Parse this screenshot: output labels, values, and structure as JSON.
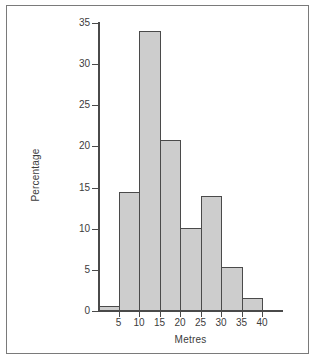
{
  "figure": {
    "background_color": "#ffffff",
    "frame_color": "#7a7a7a",
    "axis_color": "#4a4a4a",
    "bar_fill_color": "#cdcdcd",
    "bar_edge_color": "#4a4a4a"
  },
  "chart_data": {
    "type": "bar",
    "title": "",
    "subtitle": "",
    "xlabel": "Metres",
    "ylabel": "Percentage",
    "grid": false,
    "legend": null,
    "legend_position": "none",
    "xlim": [
      0,
      40
    ],
    "ylim": [
      0,
      35
    ],
    "xticks": [
      5,
      10,
      15,
      20,
      25,
      30,
      35,
      40
    ],
    "xtick_labels": [
      "5",
      "10",
      "15",
      "20",
      "25",
      "30",
      "35",
      "40"
    ],
    "yticks": [
      0,
      5,
      10,
      15,
      20,
      25,
      30,
      35
    ],
    "ytick_labels": [
      "0",
      "5",
      "10",
      "15",
      "20",
      "25",
      "30",
      "35"
    ],
    "bin_width": 5,
    "bin_edges": [
      0,
      5,
      10,
      15,
      20,
      25,
      30,
      35,
      40
    ],
    "categories": [
      "0-5",
      "5-10",
      "10-15",
      "15-20",
      "20-25",
      "25-30",
      "30-35",
      "35-40"
    ],
    "values": [
      0.6,
      14.5,
      34.0,
      20.8,
      10.1,
      14.0,
      5.4,
      1.6
    ],
    "bars": [
      {
        "label": "0-5",
        "x0": 0,
        "x1": 5,
        "value": 0.6
      },
      {
        "label": "5-10",
        "x0": 5,
        "x1": 10,
        "value": 14.5
      },
      {
        "label": "10-15",
        "x0": 10,
        "x1": 15,
        "value": 34.0
      },
      {
        "label": "15-20",
        "x0": 15,
        "x1": 20,
        "value": 20.8
      },
      {
        "label": "20-25",
        "x0": 20,
        "x1": 25,
        "value": 10.1
      },
      {
        "label": "25-30",
        "x0": 25,
        "x1": 30,
        "value": 14.0
      },
      {
        "label": "30-35",
        "x0": 30,
        "x1": 35,
        "value": 5.4
      },
      {
        "label": "35-40",
        "x0": 35,
        "x1": 40,
        "value": 1.6
      }
    ]
  }
}
